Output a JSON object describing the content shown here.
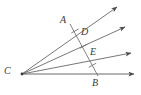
{
  "figure": {
    "background_color": "#ffffff",
    "line_color": "#555555",
    "baseline_color": "#b0b0b0",
    "label_color": "#3a3a3a",
    "labels": {
      "A": "A",
      "B": "B",
      "C": "C",
      "D": "D",
      "E": "E"
    },
    "points": [
      {
        "name": "C",
        "label": "C",
        "x": 22,
        "y": 74,
        "role": "vertex"
      },
      {
        "name": "A",
        "label": "A",
        "x": 71,
        "y": 25,
        "role": "transversal-endpoint"
      },
      {
        "name": "D",
        "label": "D",
        "x": 79,
        "y": 36,
        "role": "intersection"
      },
      {
        "name": "E",
        "label": "E",
        "x": 88,
        "y": 56,
        "role": "intersection"
      },
      {
        "name": "B",
        "label": "B",
        "x": 97,
        "y": 74,
        "role": "transversal-endpoint"
      }
    ],
    "rays": [
      {
        "name": "ray-CA",
        "from": "C",
        "through": "A",
        "tip_x": 117,
        "tip_y": 7,
        "arrow": true
      },
      {
        "name": "ray-CD",
        "from": "C",
        "through": "D",
        "tip_x": 125,
        "tip_y": 27,
        "arrow": true
      },
      {
        "name": "ray-CE",
        "from": "C",
        "through": "E",
        "tip_x": 131,
        "tip_y": 53,
        "arrow": true
      },
      {
        "name": "ray-CB",
        "from": "C",
        "through": "B",
        "tip_x": 134,
        "tip_y": 74,
        "arrow": true
      }
    ],
    "transversal": {
      "name": "segment-AB",
      "from": "A",
      "to": "B",
      "segments": [
        {
          "name": "segment-AD",
          "from": "A",
          "to": "D",
          "tick_marks": 1
        },
        {
          "name": "segment-DE",
          "from": "D",
          "to": "E",
          "tick_marks": 1
        },
        {
          "name": "segment-EB",
          "from": "E",
          "to": "B",
          "tick_marks": 1
        }
      ],
      "congruent": true
    },
    "tick_marks": [
      {
        "name": "tick-AD",
        "x": 75,
        "y": 30.5
      },
      {
        "name": "tick-DE",
        "x": 83.5,
        "y": 46
      },
      {
        "name": "tick-EB",
        "x": 92.5,
        "y": 65
      }
    ]
  }
}
